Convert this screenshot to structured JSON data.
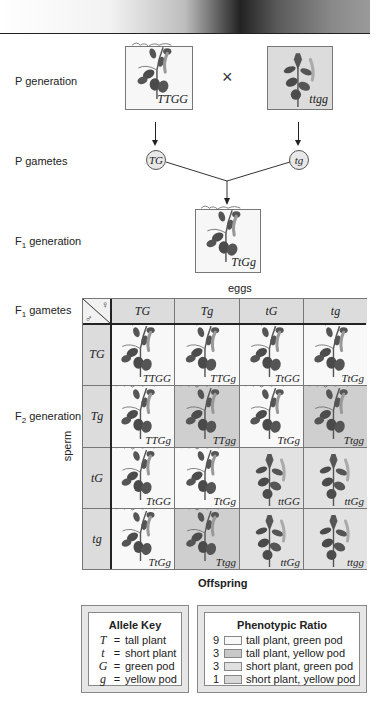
{
  "rows": {
    "p_generation": "P generation",
    "p_gametes": "P gametes",
    "f1_generation_prefix": "F",
    "f1_generation_sub": "1",
    "f1_generation_suffix": " generation",
    "f1_gametes_prefix": "F",
    "f1_gametes_sub": "1",
    "f1_gametes_suffix": " gametes",
    "f2_generation_prefix": "F",
    "f2_generation_sub": "2",
    "f2_generation_suffix": " generation"
  },
  "parents": {
    "left_genotype": "TTGG",
    "right_genotype": "ttgg",
    "cross_symbol": "×"
  },
  "gametes": {
    "left": "TG",
    "right": "tg"
  },
  "f1": {
    "genotype": "TtGg"
  },
  "punnett": {
    "eggs_label": "eggs",
    "sperm_label": "sperm",
    "female_symbol": "♀",
    "male_symbol": "♂",
    "offspring_label": "Offspring",
    "egg_gametes": [
      "TG",
      "Tg",
      "tG",
      "tg"
    ],
    "sperm_gametes": [
      "TG",
      "Tg",
      "tG",
      "tg"
    ],
    "cells": [
      [
        {
          "g": "TTGG",
          "shade": "light",
          "tall": true
        },
        {
          "g": "TTGg",
          "shade": "light",
          "tall": true
        },
        {
          "g": "TtGG",
          "shade": "light",
          "tall": true
        },
        {
          "g": "TtGg",
          "shade": "light",
          "tall": true
        }
      ],
      [
        {
          "g": "TTGg",
          "shade": "light",
          "tall": true
        },
        {
          "g": "TTgg",
          "shade": "dark",
          "tall": true
        },
        {
          "g": "TtGg",
          "shade": "light",
          "tall": true
        },
        {
          "g": "Ttgg",
          "shade": "dark",
          "tall": true
        }
      ],
      [
        {
          "g": "TtGG",
          "shade": "light",
          "tall": true
        },
        {
          "g": "TtGg",
          "shade": "light",
          "tall": true
        },
        {
          "g": "ttGG",
          "shade": "mid",
          "tall": false
        },
        {
          "g": "ttGg",
          "shade": "mid",
          "tall": false
        }
      ],
      [
        {
          "g": "TtGg",
          "shade": "light",
          "tall": true
        },
        {
          "g": "Ttgg",
          "shade": "dark",
          "tall": true
        },
        {
          "g": "ttGg",
          "shade": "mid",
          "tall": false
        },
        {
          "g": "ttgg",
          "shade": "mid",
          "tall": false
        }
      ]
    ]
  },
  "allele_key": {
    "title": "Allele Key",
    "items": [
      {
        "symbol": "T",
        "eq": "=",
        "meaning": "tall plant"
      },
      {
        "symbol": "t",
        "eq": "=",
        "meaning": "short plant"
      },
      {
        "symbol": "G",
        "eq": "=",
        "meaning": "green pod"
      },
      {
        "symbol": "g",
        "eq": "=",
        "meaning": "yellow pod"
      }
    ]
  },
  "phenotypic_ratio": {
    "title": "Phenotypic Ratio",
    "items": [
      {
        "count": "9",
        "color": "#f8f8f8",
        "label": "tall plant, green pod"
      },
      {
        "count": "3",
        "color": "#c8c8c8",
        "label": "tall plant, yellow pod"
      },
      {
        "count": "3",
        "color": "#e0e0e0",
        "label": "short plant, green pod"
      },
      {
        "count": "1",
        "color": "#d8d8d8",
        "label": "short plant, yellow pod"
      }
    ]
  },
  "colors": {
    "light_cell": "#f8f8f8",
    "mid_cell": "#e2e2e2",
    "dark_cell": "#cfcfcf",
    "header_cell": "#dcdcdc",
    "plant": "#555555"
  }
}
